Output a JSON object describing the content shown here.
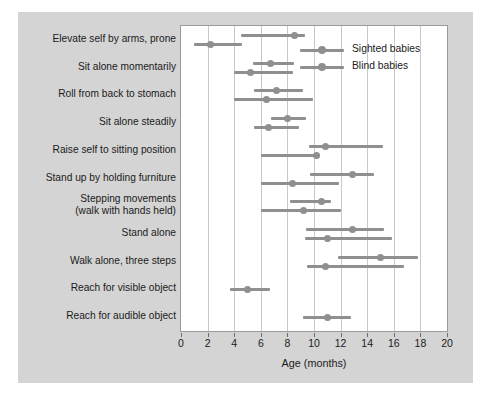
{
  "chart_data": {
    "type": "bar",
    "title": "",
    "xlabel": "Age (months)",
    "ylabel": "",
    "xlim": [
      0,
      20
    ],
    "xticks": [
      0,
      2,
      4,
      6,
      8,
      10,
      12,
      14,
      16,
      18,
      20
    ],
    "xticklabels": [
      "0",
      "2",
      "4",
      "6",
      "8",
      "10",
      "12",
      "14",
      "16",
      "18",
      "20"
    ],
    "grid": "vertical",
    "legend_position": "top-right",
    "legend": [
      "Sighted babies",
      "Blind babies"
    ],
    "colors": {
      "bar": "#8f8f8f",
      "plot_background": "#ffffff",
      "figure_background": "#d4d4d4",
      "gridline": "#c9c9c9",
      "text": "#1b1b1b"
    },
    "note": "Horizontal range bars with median dot. Upper bar in each row = Sighted babies, lower bar = Blind babies.",
    "categories": [
      "Elevate self by arms, prone",
      "Sit alone momentarily",
      "Roll from back to stomach",
      "Sit alone steadily",
      "Raise self to sitting position",
      "Stand up by holding furniture",
      "Stepping movements\n(walk with hands held)",
      "Stand alone",
      "Walk alone, three steps",
      "Reach for visible object",
      "Reach for audible object"
    ],
    "series": [
      {
        "name": "Sighted babies",
        "ranges": [
          [
            4.5,
            9.3
          ],
          [
            5.4,
            8.5
          ],
          [
            5.5,
            9.2
          ],
          [
            6.8,
            9.4
          ],
          [
            9.6,
            15.2
          ],
          [
            9.7,
            14.5
          ],
          [
            8.2,
            11.3
          ],
          [
            9.4,
            15.3
          ],
          [
            11.8,
            17.8
          ],
          null,
          null
        ],
        "medians": [
          8.5,
          6.7,
          7.2,
          8.0,
          10.9,
          12.9,
          10.6,
          12.9,
          15.0,
          null,
          null
        ]
      },
      {
        "name": "Blind babies",
        "ranges": [
          [
            1.0,
            4.6
          ],
          [
            4.0,
            8.4
          ],
          [
            4.0,
            9.9
          ],
          [
            5.5,
            8.9
          ],
          [
            6.0,
            10.1
          ],
          [
            6.0,
            11.9
          ],
          [
            6.0,
            12.0
          ],
          [
            9.3,
            15.9
          ],
          [
            9.5,
            16.8
          ],
          [
            3.7,
            6.7
          ],
          [
            9.2,
            12.8
          ]
        ],
        "medians": [
          2.2,
          5.2,
          6.4,
          6.6,
          10.2,
          8.4,
          9.2,
          11.0,
          10.9,
          5.0,
          11.0
        ]
      }
    ]
  }
}
